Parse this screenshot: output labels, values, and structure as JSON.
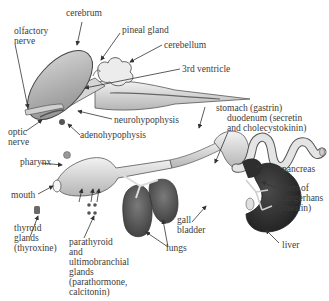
{
  "diagram": {
    "labels": {
      "cerebrum": "cerebrum",
      "olfactory_nerve": [
        "olfactory",
        "nerve"
      ],
      "pineal_gland": "pineal gland",
      "cerebellum": "cerebellum",
      "third_ventricle": "3rd ventricle",
      "neurohypophysis": "neurohypophysis",
      "adenohypophysis": "adenohypophysis",
      "optic_nerve": [
        "optic",
        "nerve"
      ],
      "stomach": "stomach (gastrin)",
      "duodenum": [
        "duodenum (secretin",
        "and cholecystokinin)"
      ],
      "pharynx": "pharynx",
      "pancreas": "pancreas",
      "mouth": "mouth",
      "islets": [
        "islets of",
        "Langerhans",
        "(insulin)"
      ],
      "thyroid": [
        "thyroid",
        "glands",
        "(thyroxine)"
      ],
      "gall_bladder": [
        "gall",
        "bladder"
      ],
      "parathyroid": [
        "parathyroid",
        "and",
        "ultimobranchial",
        "glands",
        "(parathormone,",
        "calcitonin)"
      ],
      "lungs": "lungs",
      "liver": "liver"
    },
    "colors": {
      "ink": "#3c3c3c",
      "tissue_light": "#e6e6e6",
      "tissue_mid": "#bdbdbd",
      "organ_dark": "#2a2a2a",
      "lung": "#555555"
    }
  }
}
